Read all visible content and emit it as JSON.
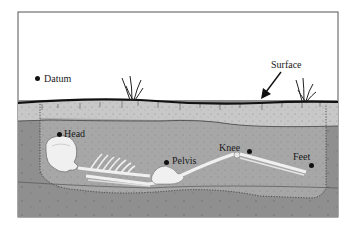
{
  "diagram": {
    "type": "burial cross-section",
    "labels": {
      "datum": "Datum",
      "surface": "Surface",
      "head": "Head",
      "pelvis": "Pelvis",
      "knee": "Knee",
      "feet": "Feet"
    },
    "colors": {
      "sky": "#ffffff",
      "topsoil": "#c9c9c9",
      "fill": "#a9a9a9",
      "subsoil": "#8e8e8e",
      "bone": "#f2f2f2",
      "outline": "#222222"
    }
  }
}
